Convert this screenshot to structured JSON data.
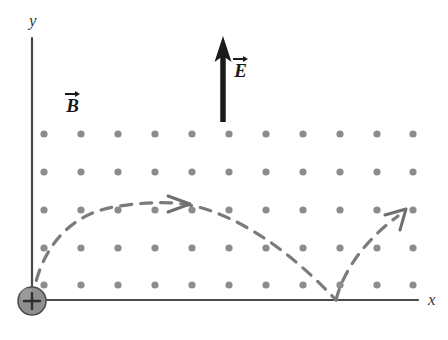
{
  "figure": {
    "width": 448,
    "height": 340,
    "background": "#ffffff"
  },
  "axes": {
    "x_label": "x",
    "y_label": "y",
    "color": "#4a4a4a",
    "origin": {
      "x": 32,
      "y": 300
    },
    "x_axis": {
      "x_start": 32,
      "x_end": 418,
      "y": 300
    },
    "y_axis": {
      "x": 32,
      "y_start": 38,
      "y_end": 300
    }
  },
  "vectors": [
    {
      "name": "electric-field",
      "label": "E",
      "direction": "up",
      "color": "#1a1a1a",
      "tail": {
        "x": 223,
        "y": 120
      },
      "head": {
        "x": 223,
        "y": 38
      }
    },
    {
      "name": "magnetic-field",
      "label": "B",
      "direction": "out-of-page",
      "color": "#1a1a1a",
      "label_position": {
        "x": 65,
        "y": 90
      }
    }
  ],
  "field_dots": {
    "name": "magnetic-field-out-of-page-dots",
    "color": "#8c8c8c",
    "radius": 3.6,
    "columns": 11,
    "rows": 5,
    "x_start": 44,
    "x_spacing": 37,
    "y_start": 134,
    "y_spacing": 37.8,
    "xs": [
      44,
      81,
      118,
      155,
      192,
      229,
      266,
      303,
      340,
      377,
      413
    ],
    "ys": [
      134,
      172,
      210,
      248,
      285
    ]
  },
  "charge": {
    "name": "positive-charge",
    "symbol": "+",
    "fill": "#8a8a8a",
    "stroke": "#4a4a4a",
    "radius": 14,
    "center": {
      "x": 32,
      "y": 301
    }
  },
  "trajectory": {
    "name": "cycloid-path",
    "style": "dashed",
    "color": "#7b7b7b",
    "stroke_width": 3.2,
    "dash_pattern": "11 9",
    "arch_1": {
      "start": {
        "x": 32,
        "y": 300
      },
      "apex": {
        "x": 200,
        "y": 203
      },
      "end": {
        "x": 336,
        "y": 300
      }
    },
    "arch_2": {
      "start": {
        "x": 336,
        "y": 300
      },
      "end": {
        "x": 404,
        "y": 212
      }
    },
    "arrowheads": [
      {
        "name": "apex-arrowhead",
        "x": 182,
        "y": 203,
        "direction": "right"
      },
      {
        "name": "exit-arrowhead",
        "x": 404,
        "y": 212,
        "direction": "up-right"
      }
    ]
  }
}
